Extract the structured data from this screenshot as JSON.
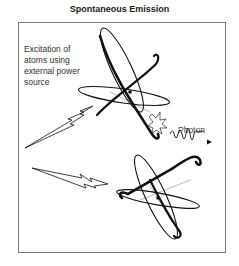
{
  "title": "Spontaneous Emission",
  "labels": {
    "excitation_line1": "Excitation of",
    "excitation_line2": "atoms using",
    "excitation_line3": "external power",
    "excitation_line4": "source",
    "photon": "Photon"
  },
  "elements": {
    "atoms": [
      "excited-atom",
      "ground-atom"
    ],
    "energy_bolts": 2,
    "emission": [
      "burst",
      "wave-with-arrow"
    ]
  },
  "colors": {
    "line": "#111111",
    "thin_line": "#999999",
    "frame": "#777777",
    "text": "#333333"
  }
}
